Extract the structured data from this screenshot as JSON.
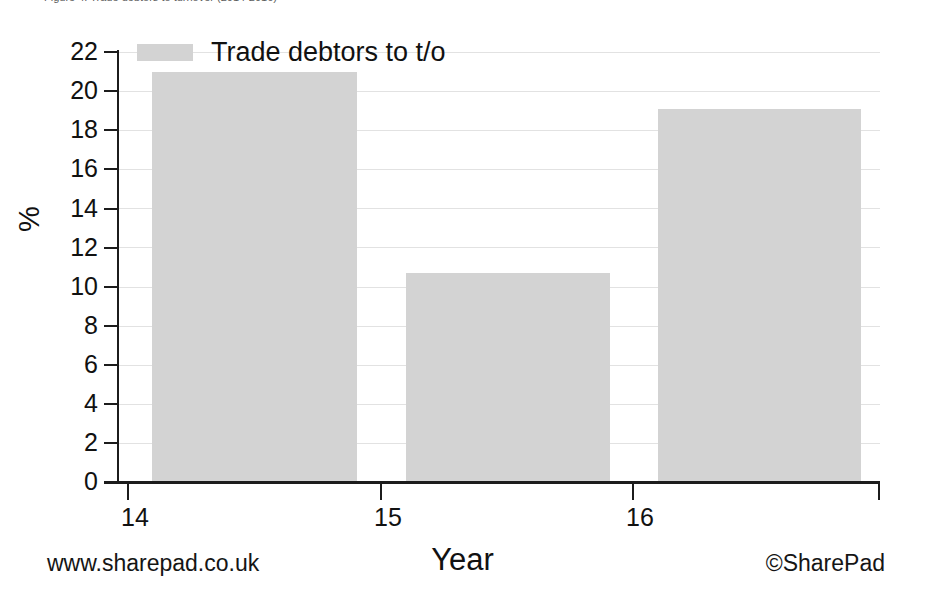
{
  "caption": {
    "text": "Figure 4: Trade debtors to turnover (2014-2016)"
  },
  "chart_data": {
    "type": "bar",
    "title": "",
    "categories": [
      "14",
      "15",
      "16"
    ],
    "values": [
      21.0,
      10.7,
      19.1
    ],
    "series": [
      {
        "name": "Trade debtors to t/o",
        "values": [
          21.0,
          10.7,
          19.1
        ]
      }
    ],
    "xlabel": "Year",
    "ylabel": "%",
    "ylim": [
      0,
      22
    ],
    "ytick_labels": [
      "22",
      "20",
      "18",
      "16",
      "14",
      "12",
      "10",
      "8",
      "6",
      "4",
      "2",
      "0"
    ],
    "ytick_values": [
      22,
      20,
      18,
      16,
      14,
      12,
      10,
      8,
      6,
      4,
      2,
      0
    ],
    "xtick_labels": [
      "14",
      "15",
      "16"
    ],
    "grid": true,
    "legend_position": "top-left",
    "bar_color": "#d3d3d3",
    "axis_color": "#1c1c1c",
    "grid_color": "#e2e2e2"
  },
  "legend": {
    "label": "Trade debtors to t/o"
  },
  "footer": {
    "left": "www.sharepad.co.uk",
    "right": "©SharePad"
  }
}
